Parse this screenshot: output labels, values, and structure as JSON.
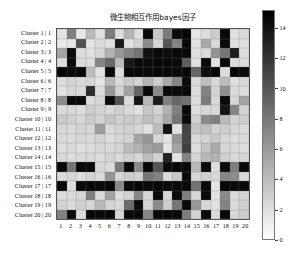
{
  "chart_data": {
    "type": "heatmap",
    "title": "微生物相互作用bayes因子",
    "xlabel": "",
    "ylabel": "",
    "grid": true,
    "colormap": "grey_reversed",
    "colorbar": {
      "position": "right",
      "orientation": "vertical",
      "vmin": 0,
      "vmax": 15.2,
      "ticks": [
        0,
        2,
        4,
        6,
        8,
        10,
        12,
        14
      ],
      "tick_labels": [
        "0",
        "2",
        "4",
        "6",
        "8",
        "10",
        "12",
        "14"
      ],
      "low_color": "#ffffff",
      "high_color": "#000000"
    },
    "x_tick_labels": [
      "1",
      "2",
      "3",
      "4",
      "5",
      "6",
      "7",
      "8",
      "9",
      "10",
      "11",
      "12",
      "13",
      "14",
      "15",
      "16",
      "17",
      "18",
      "19",
      "20"
    ],
    "y_tick_labels": [
      "Cluster 1 | 1",
      "Cluster 2 | 2",
      "Cluster 3 | 3",
      "Cluster 4 | 4",
      "Cluster 5 | 5",
      "Cluster 6 | 6",
      "Cluster 7 | 7",
      "Cluster 8 | 8",
      "Cluster 9 | 9",
      "Cluster 10 | 10",
      "Cluster 11 | 11",
      "Cluster 12 | 12",
      "Cluster 13 | 13",
      "Cluster 14 | 14",
      "Cluster 15 | 15",
      "Cluster 16 | 16",
      "Cluster 17 | 17",
      "Cluster 18 | 18",
      "Cluster 19 | 19",
      "Cluster 20 | 20"
    ],
    "values": [
      [
        1.6,
        7.6,
        1.5,
        4.2,
        1.8,
        7.8,
        2.1,
        4.5,
        2.0,
        14.8,
        3.2,
        7.8,
        14.6,
        14.9,
        1.5,
        2.0,
        3.0,
        14.8,
        1.8,
        2.2
      ],
      [
        1.4,
        1.5,
        10.5,
        1.6,
        2.2,
        1.8,
        13.8,
        1.7,
        2.6,
        7.0,
        2.4,
        10.2,
        7.4,
        14.7,
        1.8,
        5.2,
        2.2,
        14.6,
        1.7,
        1.9
      ],
      [
        5.4,
        14.6,
        2.0,
        1.8,
        2.4,
        4.6,
        6.2,
        7.4,
        8.4,
        14.2,
        14.6,
        14.5,
        14.7,
        14.8,
        1.9,
        2.3,
        6.4,
        8.2,
        13.4,
        2.0
      ],
      [
        2.0,
        14.7,
        2.2,
        2.0,
        7.2,
        9.0,
        4.0,
        13.8,
        14.6,
        14.5,
        14.7,
        14.8,
        14.6,
        9.6,
        1.8,
        14.6,
        1.6,
        14.7,
        2.0,
        2.1
      ],
      [
        14.8,
        14.6,
        14.7,
        4.0,
        1.7,
        14.6,
        2.0,
        14.8,
        14.7,
        14.6,
        14.8,
        14.7,
        14.6,
        14.8,
        9.2,
        14.5,
        14.7,
        2.0,
        14.8,
        14.6
      ],
      [
        2.0,
        2.6,
        2.2,
        2.4,
        1.6,
        4.2,
        2.2,
        3.2,
        2.6,
        4.4,
        3.0,
        5.0,
        7.2,
        14.6,
        2.2,
        3.8,
        2.2,
        4.0,
        1.8,
        2.4
      ],
      [
        1.8,
        2.4,
        2.2,
        12.6,
        2.0,
        6.2,
        2.6,
        5.4,
        9.2,
        14.6,
        7.0,
        14.7,
        14.6,
        14.7,
        2.0,
        7.4,
        2.6,
        6.6,
        2.2,
        2.0
      ],
      [
        6.8,
        14.7,
        14.6,
        2.0,
        2.4,
        14.6,
        10.4,
        2.0,
        14.0,
        4.2,
        13.6,
        7.6,
        9.0,
        8.4,
        2.0,
        7.8,
        2.2,
        14.7,
        2.4,
        5.4
      ],
      [
        2.2,
        2.4,
        2.0,
        3.0,
        2.6,
        2.4,
        2.8,
        2.2,
        1.7,
        3.4,
        2.6,
        4.6,
        7.6,
        14.6,
        2.0,
        2.4,
        2.2,
        14.0,
        7.2,
        2.6
      ],
      [
        3.2,
        2.8,
        2.4,
        3.0,
        2.6,
        3.4,
        2.8,
        3.2,
        3.0,
        3.8,
        3.2,
        5.2,
        8.2,
        14.6,
        2.8,
        7.0,
        7.6,
        4.2,
        2.6,
        3.0
      ],
      [
        2.4,
        2.2,
        2.6,
        2.4,
        5.8,
        2.2,
        2.6,
        2.8,
        2.4,
        1.8,
        4.0,
        14.2,
        1.8,
        11.2,
        3.4,
        3.8,
        2.6,
        3.0,
        2.4,
        2.2
      ],
      [
        2.2,
        2.0,
        2.4,
        2.2,
        2.6,
        2.0,
        2.4,
        2.6,
        5.4,
        6.2,
        2.4,
        1.6,
        6.2,
        11.0,
        2.2,
        2.6,
        3.2,
        2.4,
        2.0,
        2.2
      ],
      [
        2.0,
        2.2,
        1.8,
        2.0,
        2.4,
        2.2,
        2.6,
        4.0,
        4.6,
        5.6,
        6.0,
        1.5,
        5.4,
        11.4,
        2.0,
        3.6,
        5.0,
        2.4,
        2.2,
        2.0
      ],
      [
        2.4,
        2.0,
        2.2,
        2.4,
        2.0,
        2.6,
        2.2,
        2.8,
        2.4,
        4.0,
        2.6,
        13.2,
        1.6,
        7.4,
        2.4,
        4.2,
        4.6,
        2.8,
        2.2,
        2.4
      ],
      [
        14.6,
        8.2,
        14.7,
        14.6,
        2.4,
        2.2,
        8.0,
        14.6,
        7.0,
        14.7,
        10.2,
        14.6,
        14.8,
        14.7,
        4.2,
        14.6,
        2.0,
        14.6,
        7.8,
        14.7
      ],
      [
        2.2,
        2.4,
        2.0,
        2.6,
        2.2,
        6.4,
        2.4,
        3.0,
        2.6,
        8.2,
        7.4,
        2.2,
        3.4,
        14.6,
        2.4,
        2.8,
        2.2,
        7.2,
        6.8,
        2.4
      ],
      [
        14.7,
        2.0,
        14.6,
        14.7,
        14.6,
        14.7,
        7.0,
        14.6,
        14.7,
        14.6,
        14.8,
        14.7,
        14.6,
        14.7,
        8.4,
        14.6,
        1.6,
        14.7,
        14.6,
        14.7
      ],
      [
        2.0,
        2.2,
        2.4,
        7.6,
        2.2,
        5.4,
        2.0,
        2.6,
        7.2,
        2.4,
        14.6,
        2.2,
        14.6,
        7.6,
        2.4,
        14.6,
        1.7,
        7.0,
        2.2,
        2.6
      ],
      [
        2.6,
        2.2,
        2.8,
        2.4,
        4.2,
        2.6,
        2.2,
        8.8,
        14.6,
        2.6,
        7.0,
        3.0,
        8.2,
        14.6,
        6.2,
        2.4,
        1.6,
        7.4,
        2.2,
        2.8
      ],
      [
        7.6,
        14.6,
        2.2,
        14.7,
        14.6,
        14.7,
        2.4,
        14.6,
        14.7,
        7.2,
        14.6,
        14.7,
        14.6,
        7.8,
        2.6,
        14.6,
        2.2,
        14.7,
        2.4,
        3.0
      ]
    ]
  }
}
